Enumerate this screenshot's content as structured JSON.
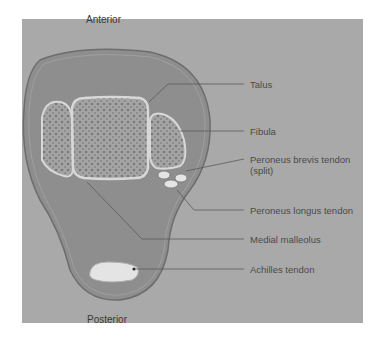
{
  "diagram": {
    "orientation": {
      "top": "Anterior",
      "bottom": "Posterior"
    },
    "labels": [
      {
        "id": "talus",
        "text": "Talus"
      },
      {
        "id": "fibula",
        "text": "Fibula"
      },
      {
        "id": "peroneus-brevis",
        "text": "Peroneus brevis tendon",
        "subtext": "(split)"
      },
      {
        "id": "peroneus-longus",
        "text": "Peroneus longus tendon"
      },
      {
        "id": "medial-malleolus",
        "text": "Medial malleolus"
      },
      {
        "id": "achilles",
        "text": "Achilles tendon"
      }
    ],
    "colors": {
      "background": "#a9a9a9",
      "ankle_fill": "#8e8e8e",
      "bone_fill": "#a4a4a4",
      "bone_border": "#d8d8d8",
      "tendon_fill": "#e4e4e4",
      "leader_line": "#5a5a5a"
    }
  }
}
